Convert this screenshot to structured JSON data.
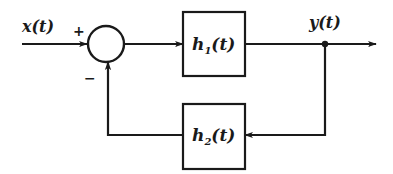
{
  "diagram": {
    "type": "feedback-block-diagram",
    "input": {
      "label": "x(t)"
    },
    "output": {
      "label": "y(t)"
    },
    "summing_junction": {
      "plus_sign": "+",
      "minus_sign": "−"
    },
    "blocks": [
      {
        "id": "forward",
        "name": "h",
        "subscript": "1",
        "arg": "(t)",
        "path": "forward"
      },
      {
        "id": "feedback",
        "name": "h",
        "subscript": "2",
        "arg": "(t)",
        "path": "feedback"
      }
    ],
    "colors": {
      "stroke": "#1a1a1a",
      "background": "#ffffff"
    }
  }
}
